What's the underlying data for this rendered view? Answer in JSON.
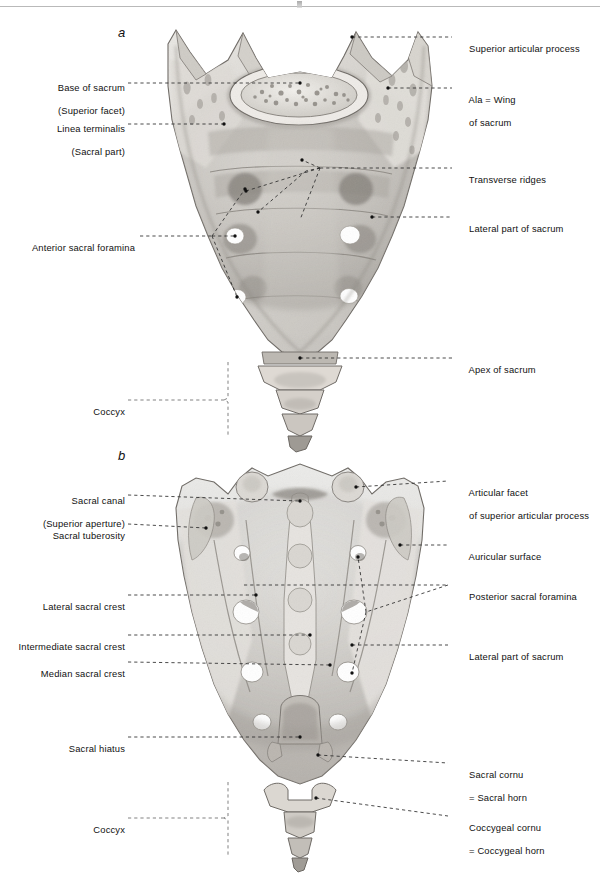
{
  "figure": {
    "panels": [
      {
        "id": "a",
        "letter": "a",
        "view": "anterior (pelvic) surface"
      },
      {
        "id": "b",
        "letter": "b",
        "view": "posterior (dorsal) surface"
      }
    ],
    "background_color": "#ffffff",
    "ink_color": "#111111",
    "leader_color": "#2c2c2c"
  },
  "panel_a": {
    "letter": "a",
    "labels_left": [
      {
        "id": "base-of-sacrum",
        "line1": "Base of sacrum",
        "line2": "(Superior facet)"
      },
      {
        "id": "linea-terminalis",
        "line1": "Linea terminalis",
        "line2": "(Sacral part)"
      },
      {
        "id": "anterior-sacral-foramina",
        "line1": "Anterior sacral foramina",
        "line2": ""
      },
      {
        "id": "coccyx-a",
        "line1": "Coccyx",
        "line2": ""
      }
    ],
    "labels_right": [
      {
        "id": "superior-articular-process",
        "line1": "Superior articular process",
        "line2": ""
      },
      {
        "id": "ala-wing-of-sacrum",
        "line1": "Ala = Wing",
        "line2": "of sacrum"
      },
      {
        "id": "transverse-ridges",
        "line1": "Transverse ridges",
        "line2": ""
      },
      {
        "id": "lateral-part-of-sacrum-a",
        "line1": "Lateral part of sacrum",
        "line2": ""
      },
      {
        "id": "apex-of-sacrum",
        "line1": "Apex of sacrum",
        "line2": ""
      }
    ]
  },
  "panel_b": {
    "letter": "b",
    "labels_left": [
      {
        "id": "sacral-canal",
        "line1": "Sacral canal",
        "line2": "(Superior aperture)"
      },
      {
        "id": "sacral-tuberosity",
        "line1": "Sacral tuberosity",
        "line2": ""
      },
      {
        "id": "lateral-sacral-crest",
        "line1": "Lateral sacral crest",
        "line2": ""
      },
      {
        "id": "intermediate-sacral-crest",
        "line1": "Intermediate sacral crest",
        "line2": ""
      },
      {
        "id": "median-sacral-crest",
        "line1": "Median sacral crest",
        "line2": ""
      },
      {
        "id": "sacral-hiatus",
        "line1": "Sacral hiatus",
        "line2": ""
      },
      {
        "id": "coccyx-b",
        "line1": "Coccyx",
        "line2": ""
      }
    ],
    "labels_right": [
      {
        "id": "articular-facet",
        "line1": "Articular facet",
        "line2": "of superior articular process"
      },
      {
        "id": "auricular-surface",
        "line1": "Auricular surface",
        "line2": ""
      },
      {
        "id": "posterior-sacral-foramina",
        "line1": "Posterior sacral foramina",
        "line2": ""
      },
      {
        "id": "lateral-part-of-sacrum-b",
        "line1": "Lateral part of sacrum",
        "line2": ""
      },
      {
        "id": "sacral-cornu",
        "line1": "Sacral cornu",
        "line2": "= Sacral horn"
      },
      {
        "id": "coccygeal-cornu",
        "line1": "Coccygeal cornu",
        "line2": "= Coccygeal horn"
      }
    ]
  }
}
